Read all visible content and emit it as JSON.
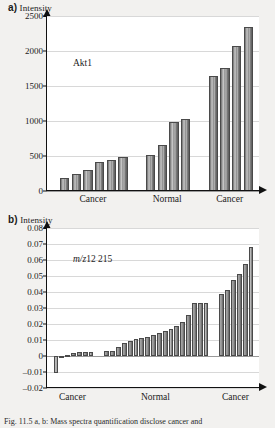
{
  "figure": {
    "background": "#f2f1ef",
    "bar_fill": "#9a9a9a",
    "bar_edge": "#4a4a4a",
    "grid_color": "#d8d8d8",
    "axis_color": "#111111",
    "caption": "Fig. 11.5 a, b: Mass spectra quantification disclose cancer and"
  },
  "panels": [
    {
      "id": "a",
      "letter": "a)",
      "axis_title": "Intensity",
      "annotation": "Akt1",
      "annotation_italic": "",
      "ytick_labels": [
        "2500",
        "2000",
        "1500",
        "1000",
        "500",
        "0"
      ]
    },
    {
      "id": "b",
      "letter": "b)",
      "axis_title": "Intensity",
      "annotation": "12 215",
      "annotation_italic": "m/z",
      "ytick_labels": [
        "0.08",
        "0.07",
        "0.06",
        "0.05",
        "0.04",
        "0.03",
        "0.02",
        "0.01",
        "0",
        "–0.01",
        "–0.02"
      ]
    }
  ],
  "chart_data": [
    {
      "type": "bar",
      "panel": "a",
      "title": "Akt1",
      "xlabel": "",
      "ylabel": "Intensity",
      "ylim": [
        0,
        2500
      ],
      "yticks": [
        0,
        500,
        1000,
        1500,
        2000,
        2500
      ],
      "grid": true,
      "legend": "none",
      "group_labels": [
        "Cancer",
        "Normal",
        "Cancer"
      ],
      "groups": [
        {
          "label": "Cancer",
          "values": [
            185,
            250,
            300,
            410,
            450,
            480
          ]
        },
        {
          "label": "Normal",
          "values": [
            515,
            655,
            985,
            1025
          ]
        },
        {
          "label": "Cancer",
          "values": [
            1640,
            1760,
            2065,
            2340
          ]
        }
      ]
    },
    {
      "type": "bar",
      "panel": "b",
      "title": "m/z 12 215",
      "xlabel": "",
      "ylabel": "Intensity",
      "ylim": [
        -0.02,
        0.08
      ],
      "yticks": [
        -0.02,
        -0.01,
        0,
        0.01,
        0.02,
        0.03,
        0.04,
        0.05,
        0.06,
        0.07,
        0.08
      ],
      "grid": true,
      "legend": "none",
      "group_labels": [
        "Cancer",
        "Normal",
        "Cancer"
      ],
      "groups": [
        {
          "label": "Cancer",
          "values": [
            -0.0105,
            -0.0008,
            0.0009,
            0.0016,
            0.0022,
            0.0023,
            0.0023
          ]
        },
        {
          "label": "Normal",
          "values": [
            0.0031,
            0.0033,
            0.0055,
            0.0079,
            0.0094,
            0.0105,
            0.0113,
            0.0118,
            0.0131,
            0.0146,
            0.0157,
            0.017,
            0.0188,
            0.0215,
            0.0259,
            0.0331,
            0.0334,
            0.0334
          ]
        },
        {
          "label": "Cancer",
          "values": [
            0.0389,
            0.0412,
            0.0477,
            0.051,
            0.0572,
            0.0679
          ]
        }
      ]
    }
  ]
}
